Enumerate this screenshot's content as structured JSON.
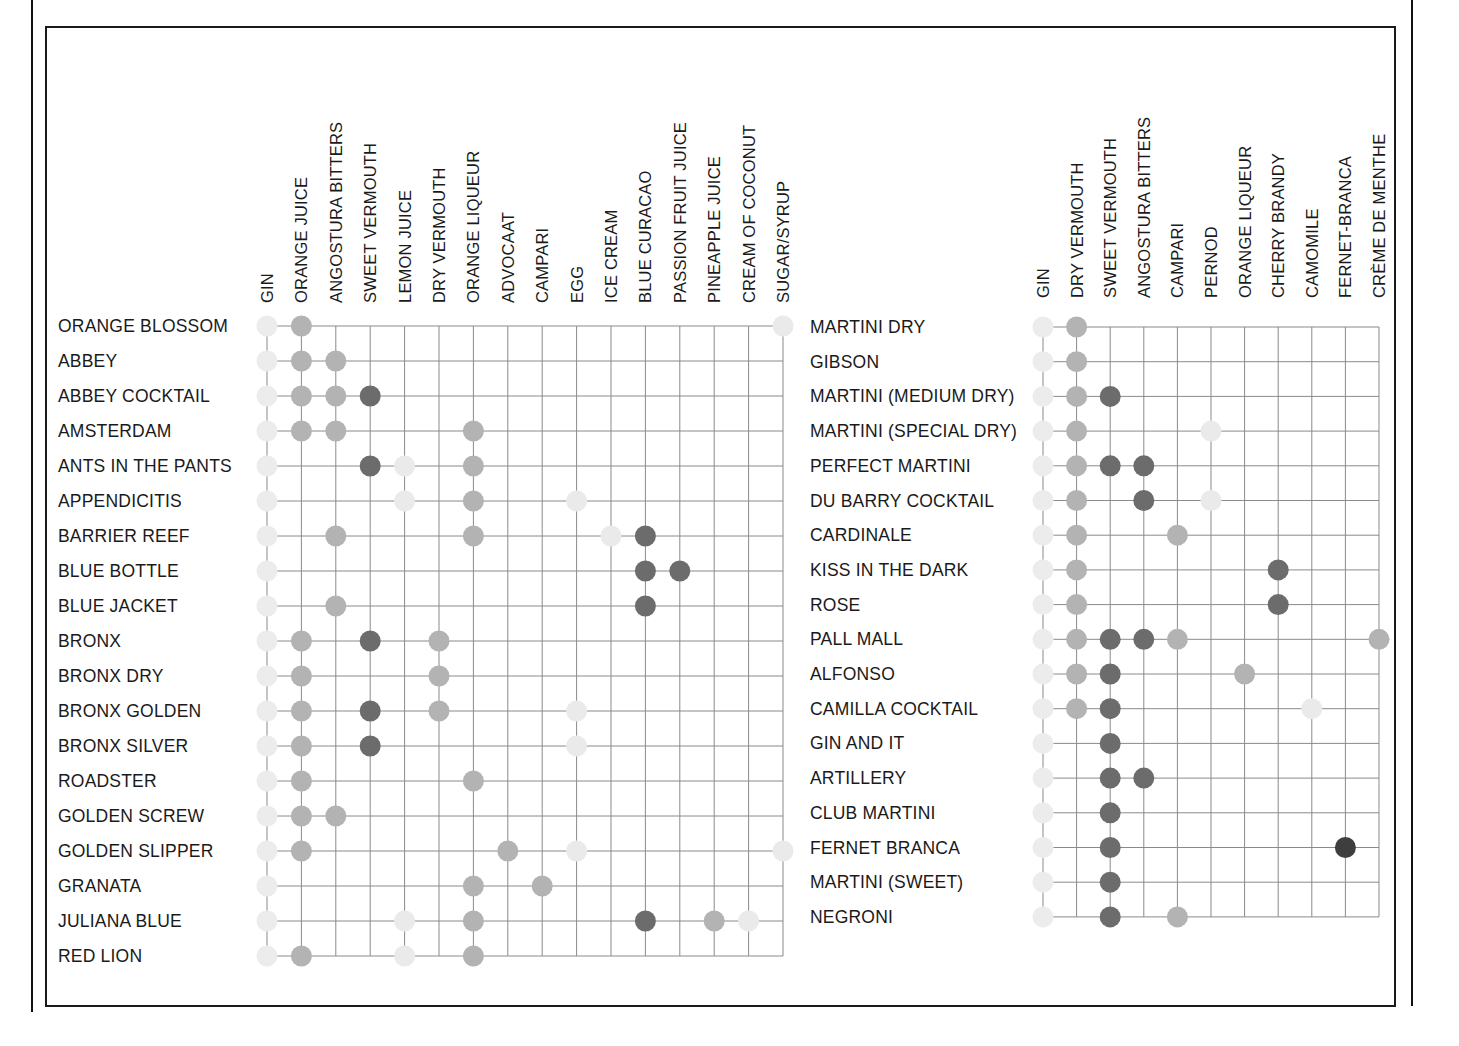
{
  "colors": {
    "gin": "#ececec",
    "light": "#eaeaea",
    "mid": "#b3b3b3",
    "dark": "#6c6c6c",
    "darkest": "#3e3e3e",
    "grid": "#8a8a8a",
    "frame": "#1a1a1a"
  },
  "chart_data": [
    {
      "type": "table",
      "title": "",
      "description": "Ingredient matrix: rows are cocktails, columns are ingredients; a dot marks an ingredient used in the cocktail. Dot shade indicates ingredient color (light/mid/dark).",
      "columns": [
        "GIN",
        "ORANGE JUICE",
        "ANGOSTURA BITTERS",
        "SWEET VERMOUTH",
        "LEMON JUICE",
        "DRY VERMOUTH",
        "ORANGE LIQUEUR",
        "ADVOCAAT",
        "CAMPARI",
        "EGG",
        "ICE CREAM",
        "BLUE CURACAO",
        "PASSION FRUIT JUICE",
        "PINEAPPLE JUICE",
        "CREAM OF COCONUT",
        "SUGAR/SYRUP"
      ],
      "column_shades": [
        "gin",
        "mid",
        "mid",
        "dark",
        "light",
        "mid",
        "mid",
        "mid",
        "mid",
        "light",
        "light",
        "dark",
        "dark",
        "mid",
        "light",
        "light"
      ],
      "rows": [
        {
          "name": "ORANGE BLOSSOM",
          "ingredients": [
            0,
            1,
            15
          ]
        },
        {
          "name": "ABBEY",
          "ingredients": [
            0,
            1,
            2
          ]
        },
        {
          "name": "ABBEY COCKTAIL",
          "ingredients": [
            0,
            1,
            2,
            3
          ]
        },
        {
          "name": "AMSTERDAM",
          "ingredients": [
            0,
            1,
            2,
            6
          ]
        },
        {
          "name": "ANTS IN THE PANTS",
          "ingredients": [
            0,
            3,
            4,
            6
          ]
        },
        {
          "name": "APPENDICITIS",
          "ingredients": [
            0,
            4,
            6,
            9
          ]
        },
        {
          "name": "BARRIER REEF",
          "ingredients": [
            0,
            2,
            6,
            10,
            11
          ]
        },
        {
          "name": "BLUE BOTTLE",
          "ingredients": [
            0,
            11,
            12
          ]
        },
        {
          "name": "BLUE JACKET",
          "ingredients": [
            0,
            2,
            11
          ]
        },
        {
          "name": "BRONX",
          "ingredients": [
            0,
            1,
            3,
            5
          ]
        },
        {
          "name": "BRONX DRY",
          "ingredients": [
            0,
            1,
            5
          ]
        },
        {
          "name": "BRONX GOLDEN",
          "ingredients": [
            0,
            1,
            3,
            5,
            9
          ]
        },
        {
          "name": "BRONX SILVER",
          "ingredients": [
            0,
            1,
            3,
            9
          ]
        },
        {
          "name": "ROADSTER",
          "ingredients": [
            0,
            1,
            6
          ]
        },
        {
          "name": "GOLDEN SCREW",
          "ingredients": [
            0,
            1,
            2
          ]
        },
        {
          "name": "GOLDEN SLIPPER",
          "ingredients": [
            0,
            1,
            7,
            9,
            15
          ]
        },
        {
          "name": "GRANATA",
          "ingredients": [
            0,
            6,
            8
          ]
        },
        {
          "name": "JULIANA BLUE",
          "ingredients": [
            0,
            4,
            6,
            11,
            13,
            14
          ]
        },
        {
          "name": "RED LION",
          "ingredients": [
            0,
            1,
            4,
            6
          ]
        }
      ]
    },
    {
      "type": "table",
      "title": "",
      "description": "Ingredient matrix for martini-style gin cocktails.",
      "columns": [
        "GIN",
        "DRY VERMOUTH",
        "SWEET VERMOUTH",
        "ANGOSTURA BITTERS",
        "CAMPARI",
        "PERNOD",
        "ORANGE LIQUEUR",
        "CHERRY BRANDY",
        "CAMOMILE",
        "FERNET-BRANCA",
        "CRÈME DE MENTHE"
      ],
      "column_shades": [
        "gin",
        "mid",
        "dark",
        "dark",
        "mid",
        "light",
        "mid",
        "dark",
        "light",
        "darkest",
        "mid"
      ],
      "rows": [
        {
          "name": "MARTINI DRY",
          "ingredients": [
            0,
            1
          ]
        },
        {
          "name": "GIBSON",
          "ingredients": [
            0,
            1
          ]
        },
        {
          "name": "MARTINI (MEDIUM DRY)",
          "ingredients": [
            0,
            1,
            2
          ]
        },
        {
          "name": "MARTINI (SPECIAL DRY)",
          "ingredients": [
            0,
            1,
            5
          ]
        },
        {
          "name": "PERFECT MARTINI",
          "ingredients": [
            0,
            1,
            2,
            3
          ]
        },
        {
          "name": "DU BARRY COCKTAIL",
          "ingredients": [
            0,
            1,
            3,
            5
          ]
        },
        {
          "name": "CARDINALE",
          "ingredients": [
            0,
            1,
            4
          ]
        },
        {
          "name": "KISS IN THE DARK",
          "ingredients": [
            0,
            1,
            7
          ]
        },
        {
          "name": "ROSE",
          "ingredients": [
            0,
            1,
            7
          ]
        },
        {
          "name": "PALL MALL",
          "ingredients": [
            0,
            1,
            2,
            3,
            4,
            10
          ]
        },
        {
          "name": "ALFONSO",
          "ingredients": [
            0,
            1,
            2,
            6
          ]
        },
        {
          "name": "CAMILLA COCKTAIL",
          "ingredients": [
            0,
            1,
            2,
            8
          ]
        },
        {
          "name": "GIN AND IT",
          "ingredients": [
            0,
            2
          ]
        },
        {
          "name": "ARTILLERY",
          "ingredients": [
            0,
            2,
            3
          ]
        },
        {
          "name": "CLUB MARTINI",
          "ingredients": [
            0,
            2
          ]
        },
        {
          "name": "FERNET BRANCA",
          "ingredients": [
            0,
            2,
            9
          ]
        },
        {
          "name": "MARTINI (SWEET)",
          "ingredients": [
            0,
            2
          ]
        },
        {
          "name": "NEGRONI",
          "ingredients": [
            0,
            2,
            4
          ]
        }
      ]
    }
  ],
  "layout": {
    "grids": [
      {
        "x0": 267,
        "dx": 34.4,
        "y0": 326,
        "dy": 35,
        "label_x": 58,
        "col_label_base": 303
      },
      {
        "x0": 1043,
        "dx": 33.6,
        "y0": 327,
        "dy": 34.7,
        "label_x": 810,
        "col_label_base": 298
      }
    ]
  }
}
